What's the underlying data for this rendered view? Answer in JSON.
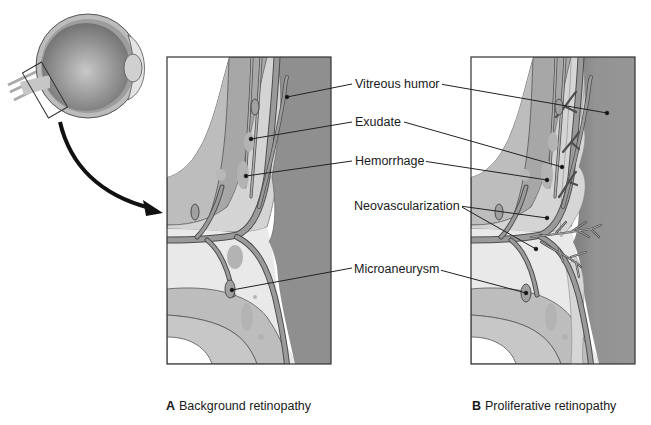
{
  "figure": {
    "inset": {
      "name": "Eyeball cross-section",
      "detail_box": "optic disc region"
    },
    "labels": [
      {
        "id": "vitreous",
        "text": "Vitreous humor"
      },
      {
        "id": "exudate",
        "text": "Exudate"
      },
      {
        "id": "hemorrhage",
        "text": "Hemorrhage"
      },
      {
        "id": "neovascularization",
        "text": "Neovascularization"
      },
      {
        "id": "microaneurysm",
        "text": "Microaneurysm"
      }
    ],
    "panels": [
      {
        "letter": "A",
        "caption": "Background retinopathy"
      },
      {
        "letter": "B",
        "caption": "Proliferative retinopathy"
      }
    ],
    "colors": {
      "vitreous": "#8f8f8f",
      "retina_light": "#e6e6e6",
      "choroid": "#bdbdbd",
      "sclera": "#a8a8a8",
      "vessel": "#9a9a9a",
      "vessel_outline": "#4d4d4d",
      "hemorrhage": "#b5b5b5",
      "outline": "#333333"
    }
  }
}
